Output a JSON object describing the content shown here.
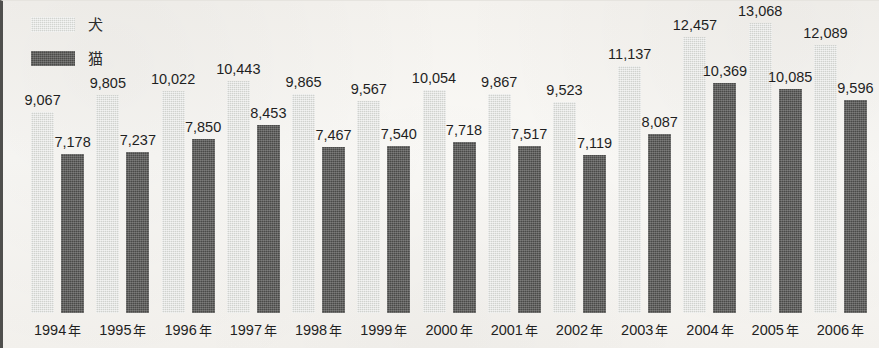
{
  "legend": {
    "items": [
      {
        "label": "犬",
        "key": "dog",
        "color": "#d0d2ce"
      },
      {
        "label": "猫",
        "key": "cat",
        "color": "#4a4a48"
      }
    ]
  },
  "axis": {
    "year_unit": "年"
  },
  "chart_data": {
    "type": "bar",
    "title": "",
    "subtitle": "",
    "xlabel": "",
    "ylabel": "",
    "grid": false,
    "legend_position": "top-left",
    "ylim": [
      0,
      13068
    ],
    "categories": [
      "1994 年",
      "1995 年",
      "1996 年",
      "1997 年",
      "1998 年",
      "1999 年",
      "2000 年",
      "2001 年",
      "2002 年",
      "2003 年",
      "2004 年",
      "2005 年",
      "2006 年"
    ],
    "x": [
      1994,
      1995,
      1996,
      1997,
      1998,
      1999,
      2000,
      2001,
      2002,
      2003,
      2004,
      2005,
      2006
    ],
    "series": [
      {
        "name": "犬",
        "color": "#d0d2ce",
        "values": [
          9067,
          9805,
          10022,
          10443,
          9865,
          9567,
          10054,
          9867,
          9523,
          11137,
          12457,
          13068,
          12089
        ],
        "labels": [
          "9,067",
          "9,805",
          "10,022",
          "10,443",
          "9,865",
          "9,567",
          "10,054",
          "9,867",
          "9,523",
          "11,137",
          "12,457",
          "13,068",
          "12,089"
        ]
      },
      {
        "name": "猫",
        "color": "#4a4a48",
        "values": [
          7178,
          7237,
          7850,
          8453,
          7467,
          7540,
          7718,
          7517,
          7119,
          8087,
          10369,
          10085,
          9596
        ],
        "labels": [
          "7,178",
          "7,237",
          "7,850",
          "8,453",
          "7,467",
          "7,540",
          "7,718",
          "7,517",
          "7,119",
          "8,087",
          "10,369",
          "10,085",
          "9,596"
        ]
      }
    ]
  }
}
